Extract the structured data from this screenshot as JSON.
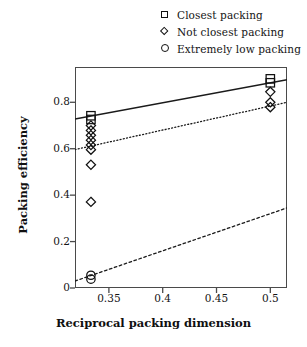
{
  "chart_data": {
    "type": "scatter",
    "title": "",
    "xlabel": "Reciprocal packing dimension",
    "ylabel": "Packing efficiency",
    "xlim": [
      0.3185,
      0.5155
    ],
    "ylim": [
      0.0,
      0.952
    ],
    "xticks": [
      0.35,
      0.4,
      0.45,
      0.5
    ],
    "xtick_labels": [
      "0.35",
      "0.4",
      "0.45",
      "0.5"
    ],
    "yticks": [
      0,
      0.2,
      0.4,
      0.6,
      0.8
    ],
    "ytick_labels": [
      "0",
      "0.2",
      "0.4",
      "0.6",
      "0.8"
    ],
    "grid": false,
    "legend_position": "above-right",
    "series": [
      {
        "name": "Closest packing",
        "marker": "square",
        "points": [
          {
            "x": 0.3333,
            "y": 0.742
          },
          {
            "x": 0.3333,
            "y": 0.726
          },
          {
            "x": 0.5,
            "y": 0.901
          },
          {
            "x": 0.5,
            "y": 0.884
          }
        ]
      },
      {
        "name": "Not closest packing",
        "marker": "diamond",
        "points": [
          {
            "x": 0.3333,
            "y": 0.7
          },
          {
            "x": 0.3333,
            "y": 0.679
          },
          {
            "x": 0.3333,
            "y": 0.658
          },
          {
            "x": 0.3333,
            "y": 0.637
          },
          {
            "x": 0.3333,
            "y": 0.616
          },
          {
            "x": 0.3333,
            "y": 0.596
          },
          {
            "x": 0.3333,
            "y": 0.531
          },
          {
            "x": 0.3333,
            "y": 0.371
          },
          {
            "x": 0.5,
            "y": 0.845
          },
          {
            "x": 0.5,
            "y": 0.8
          },
          {
            "x": 0.5,
            "y": 0.779
          }
        ]
      },
      {
        "name": "Extremely low packing",
        "marker": "circle",
        "points": [
          {
            "x": 0.3333,
            "y": 0.055
          },
          {
            "x": 0.3333,
            "y": 0.038
          }
        ]
      }
    ],
    "trend_lines": [
      {
        "name": "Closest packing fit",
        "style": "solid",
        "x": [
          0.3185,
          0.5155
        ],
        "y": [
          0.728,
          0.897
        ]
      },
      {
        "name": "Not closest packing fit",
        "style": "dotted",
        "x": [
          0.3185,
          0.5155
        ],
        "y": [
          0.596,
          0.8
        ]
      },
      {
        "name": "Extremely low packing fit",
        "style": "dashed",
        "x": [
          0.3185,
          0.5155
        ],
        "y": [
          0.03,
          0.345
        ]
      }
    ]
  },
  "legend": {
    "items": [
      {
        "marker": "square-marker-icon",
        "label": "Closest packing"
      },
      {
        "marker": "diamond-marker-icon",
        "label": "Not closest packing"
      },
      {
        "marker": "circle-marker-icon",
        "label": "Extremely low packing"
      }
    ]
  },
  "colors": {
    "line": "#1a1a1a",
    "marker": "#111111",
    "frame": "#4a4a4a",
    "text": "#141414",
    "background": "#ffffff"
  }
}
